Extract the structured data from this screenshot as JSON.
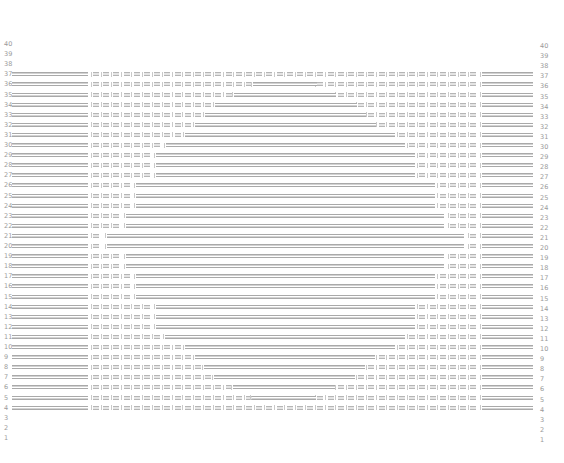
{
  "diagram": {
    "type": "row-seat-map",
    "row_labels": [
      40,
      39,
      38,
      37,
      36,
      35,
      34,
      33,
      32,
      31,
      30,
      29,
      28,
      27,
      26,
      25,
      24,
      23,
      22,
      21,
      20,
      19,
      18,
      17,
      16,
      15,
      14,
      13,
      12,
      11,
      10,
      9,
      8,
      7,
      6,
      5,
      4,
      3,
      2,
      1
    ],
    "colors": {
      "bar": "#a9a9a9",
      "seat": "#b5b5b5",
      "label": "#9a9a9a",
      "background": "#ffffff"
    },
    "layout": {
      "top_row_y": 44,
      "row_pitch": 10.1,
      "left_bar": [
        12,
        88
      ],
      "seat_area": [
        93,
        480
      ],
      "seat_pitch": 10.2,
      "right_bar": [
        482,
        533
      ]
    },
    "rows": [
      {
        "row": 40,
        "active": false
      },
      {
        "row": 39,
        "active": false
      },
      {
        "row": 38,
        "active": false
      },
      {
        "row": 37,
        "active": true,
        "merged": null
      },
      {
        "row": 36,
        "active": true,
        "merged": [
          253,
          317
        ]
      },
      {
        "row": 35,
        "active": true,
        "merged": [
          234,
          336
        ]
      },
      {
        "row": 34,
        "active": true,
        "merged": [
          215,
          357
        ]
      },
      {
        "row": 33,
        "active": true,
        "merged": [
          205,
          366
        ]
      },
      {
        "row": 32,
        "active": true,
        "merged": [
          195,
          376
        ]
      },
      {
        "row": 31,
        "active": true,
        "merged": [
          185,
          395
        ]
      },
      {
        "row": 30,
        "active": true,
        "merged": [
          166,
          405
        ]
      },
      {
        "row": 29,
        "active": true,
        "merged": [
          156,
          415
        ]
      },
      {
        "row": 28,
        "active": true,
        "merged": [
          156,
          415
        ]
      },
      {
        "row": 27,
        "active": true,
        "merged": [
          156,
          415
        ]
      },
      {
        "row": 26,
        "active": true,
        "merged": [
          136,
          435
        ]
      },
      {
        "row": 25,
        "active": true,
        "merged": [
          136,
          435
        ]
      },
      {
        "row": 24,
        "active": true,
        "merged": [
          136,
          435
        ]
      },
      {
        "row": 23,
        "active": true,
        "merged": [
          126,
          444
        ]
      },
      {
        "row": 22,
        "active": true,
        "merged": [
          126,
          444
        ]
      },
      {
        "row": 21,
        "active": true,
        "merged": [
          107,
          464
        ]
      },
      {
        "row": 20,
        "active": true,
        "merged": [
          107,
          464
        ]
      },
      {
        "row": 19,
        "active": true,
        "merged": [
          126,
          444
        ]
      },
      {
        "row": 18,
        "active": true,
        "merged": [
          126,
          444
        ]
      },
      {
        "row": 17,
        "active": true,
        "merged": [
          136,
          435
        ]
      },
      {
        "row": 16,
        "active": true,
        "merged": [
          136,
          435
        ]
      },
      {
        "row": 15,
        "active": true,
        "merged": [
          136,
          435
        ]
      },
      {
        "row": 14,
        "active": true,
        "merged": [
          156,
          415
        ]
      },
      {
        "row": 13,
        "active": true,
        "merged": [
          156,
          415
        ]
      },
      {
        "row": 12,
        "active": true,
        "merged": [
          156,
          415
        ]
      },
      {
        "row": 11,
        "active": true,
        "merged": [
          165,
          405
        ]
      },
      {
        "row": 10,
        "active": true,
        "merged": [
          185,
          395
        ]
      },
      {
        "row": 9,
        "active": true,
        "merged": [
          195,
          375
        ]
      },
      {
        "row": 8,
        "active": true,
        "merged": [
          204,
          365
        ]
      },
      {
        "row": 7,
        "active": true,
        "merged": [
          214,
          355
        ]
      },
      {
        "row": 6,
        "active": true,
        "merged": [
          233,
          335
        ]
      },
      {
        "row": 5,
        "active": true,
        "merged": [
          252,
          316
        ]
      },
      {
        "row": 4,
        "active": true,
        "merged": null
      },
      {
        "row": 3,
        "active": false
      },
      {
        "row": 2,
        "active": false
      },
      {
        "row": 1,
        "active": false
      }
    ]
  }
}
